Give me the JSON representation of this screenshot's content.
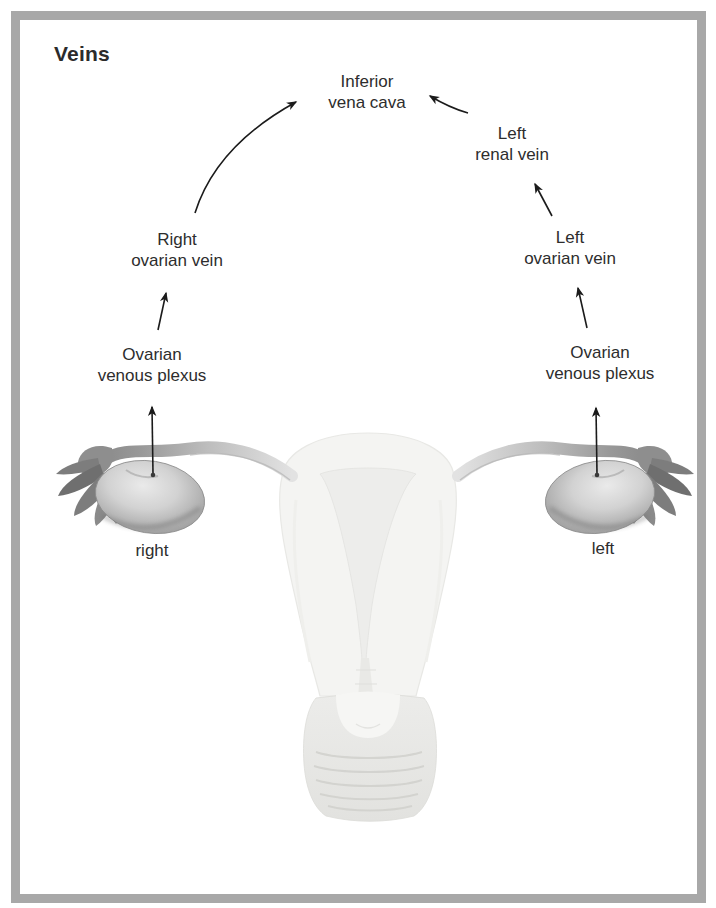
{
  "title": "Veins",
  "nodes": {
    "inferior_vena_cava": "Inferior\nvena cava",
    "left_renal_vein": "Left\nrenal vein",
    "right_ovarian_vein": "Right\novarian vein",
    "left_ovarian_vein": "Left\novarian vein",
    "right_plexus": "Ovarian\nvenous plexus",
    "left_plexus": "Ovarian\nvenous plexus",
    "right_side": "right",
    "left_side": "left"
  },
  "flow": [
    {
      "from": "right ovary",
      "to": "Ovarian venous plexus (right)"
    },
    {
      "from": "Ovarian venous plexus (right)",
      "to": "Right ovarian vein"
    },
    {
      "from": "Right ovarian vein",
      "to": "Inferior vena cava"
    },
    {
      "from": "left ovary",
      "to": "Ovarian venous plexus (left)"
    },
    {
      "from": "Ovarian venous plexus (left)",
      "to": "Left ovarian vein"
    },
    {
      "from": "Left ovarian vein",
      "to": "Left renal vein"
    },
    {
      "from": "Left renal vein",
      "to": "Inferior vena cava"
    }
  ],
  "colors": {
    "frame": "#a8a8a8",
    "text": "#2d2d2d",
    "arrow": "#1b1b1b",
    "ovary_edge": "#878787",
    "ovary_highlight": "#e8e8e8",
    "uterus_faint": "#f4f4f2"
  }
}
